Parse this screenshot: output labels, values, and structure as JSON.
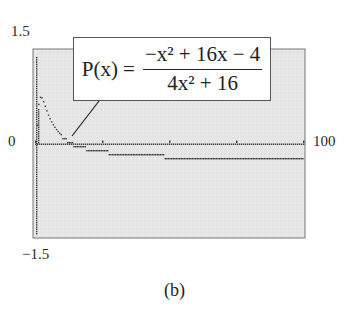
{
  "figure": {
    "caption": "(b)",
    "formula": {
      "lhs": "P(x) =",
      "numerator": "−x² + 16x − 4",
      "denominator": "4x² + 16"
    },
    "axis_labels": {
      "y_max": "1.5",
      "y_min": "−1.5",
      "x_origin": "0",
      "x_max": "100"
    }
  },
  "chart_data": {
    "type": "scatter",
    "xlabel": "",
    "ylabel": "",
    "xlim": [
      0,
      100
    ],
    "ylim": [
      -1.5,
      1.5
    ],
    "grid": false,
    "background": "#e8e8e8",
    "tick_labels": {
      "x": [
        "0",
        "100"
      ],
      "y": [
        "-1.5",
        "1.5"
      ]
    },
    "x_ticks": [
      0,
      25,
      50,
      75,
      100
    ],
    "series": [
      {
        "name": "P(x) (graphing calculator dot plot)",
        "x": [
          0,
          1,
          2,
          3,
          4,
          5,
          6,
          8,
          10,
          12,
          14,
          16,
          20,
          25,
          30,
          40,
          50,
          60,
          70,
          80,
          90,
          100
        ],
        "values": [
          -0.25,
          0.55,
          0.75,
          0.62,
          0.48,
          0.37,
          0.29,
          0.18,
          0.12,
          0.07,
          0.03,
          -0.0,
          -0.05,
          -0.09,
          -0.12,
          -0.15,
          -0.17,
          -0.19,
          -0.2,
          -0.21,
          -0.21,
          -0.21
        ]
      }
    ],
    "annotations": [
      {
        "text": "P(x) = (−x² + 16x − 4)/(4x² + 16)",
        "points_to": [
          5,
          0.05
        ]
      }
    ]
  }
}
